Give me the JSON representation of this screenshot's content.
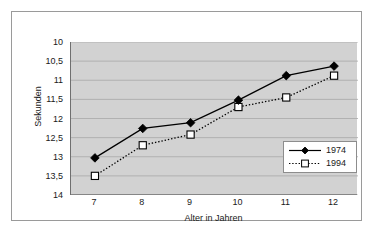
{
  "chart_data": {
    "type": "line",
    "title": "",
    "xlabel": "Alter in Jahren",
    "ylabel": "Sekunden",
    "x": [
      7,
      8,
      9,
      10,
      11,
      12
    ],
    "categories": [
      "7",
      "8",
      "9",
      "10",
      "11",
      "12"
    ],
    "xlim": [
      6.5,
      12.5
    ],
    "ylim": [
      14,
      10
    ],
    "y_inverted": true,
    "grid": true,
    "legend_position": "lower right",
    "y_ticks": [
      10,
      10.5,
      11,
      11.5,
      12,
      12.5,
      13,
      13.5,
      14
    ],
    "y_tick_labels": [
      "10",
      "10,5",
      "11",
      "11,5",
      "12",
      "12,5",
      "13",
      "13,5",
      "14"
    ],
    "x_ticks": [
      7,
      8,
      9,
      10,
      11,
      12
    ],
    "x_tick_labels": [
      "7",
      "8",
      "9",
      "10",
      "11",
      "12"
    ],
    "series": [
      {
        "name": "1974",
        "values": [
          13.03,
          12.26,
          12.11,
          11.52,
          10.88,
          10.63
        ],
        "color": "#000000",
        "line_style": "solid",
        "marker": "filled-diamond"
      },
      {
        "name": "1994",
        "values": [
          13.5,
          12.7,
          12.42,
          11.7,
          11.45,
          10.88
        ],
        "color": "#000000",
        "line_style": "dotted",
        "marker": "open-square"
      }
    ]
  },
  "legend": {
    "entries": [
      {
        "label": "1974"
      },
      {
        "label": "1994"
      }
    ]
  },
  "colors": {
    "plot_background": "#d2d2d2",
    "figure_background": "#ffffff",
    "gridline": "#a8a8a8",
    "axis": "#6f6f6f",
    "frame": "#9a9a9a",
    "text": "#1a1a1a",
    "series_1974": "#000000",
    "series_1994": "#000000"
  }
}
